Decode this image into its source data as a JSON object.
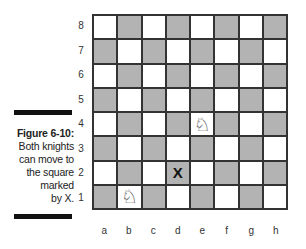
{
  "caption": {
    "figure_label": "Figure 6-10:",
    "lines": [
      "Both knights",
      "can move to",
      "the square",
      "marked",
      "by X."
    ]
  },
  "board": {
    "ranks": [
      "8",
      "7",
      "6",
      "5",
      "4",
      "3",
      "2",
      "1"
    ],
    "files": [
      "a",
      "b",
      "c",
      "d",
      "e",
      "f",
      "g",
      "h"
    ],
    "light_color": "#ffffff",
    "dark_color": "#b3b3b3",
    "pieces": [
      {
        "square": "e4",
        "piece": "white-knight",
        "glyph": "♘"
      },
      {
        "square": "b1",
        "piece": "white-knight",
        "glyph": "♘"
      }
    ],
    "markers": [
      {
        "square": "d2",
        "label": "X"
      }
    ]
  }
}
